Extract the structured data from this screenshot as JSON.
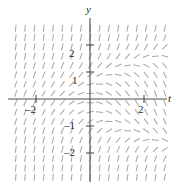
{
  "figure": {
    "width": 179,
    "height": 186,
    "background_color": "#ffffff",
    "mark_color": "#a9a9ac",
    "axis_color": "#4d4d4f",
    "text_color": "#231f20"
  },
  "axes": {
    "x_axis_label": "t",
    "y_axis_label": "y",
    "origin_px": {
      "x": 90,
      "y": 99
    },
    "unit_px": {
      "x": 27,
      "y": 27
    },
    "xlim": [
      -2.9,
      2.8
    ],
    "ylim": [
      -3.0,
      2.9
    ],
    "grid": false,
    "x_ticks": [
      {
        "value": -2,
        "label": "–2"
      },
      {
        "value": 2,
        "label": "2"
      }
    ],
    "y_ticks": [
      {
        "value": 2,
        "label": "2"
      },
      {
        "value": 1,
        "label": "1"
      },
      {
        "value": -1,
        "label": "–1"
      },
      {
        "value": -2,
        "label": "–2"
      }
    ]
  },
  "chart_data": {
    "type": "scatter",
    "xlabel": "t",
    "ylabel": "y",
    "xlim": [
      -2.9,
      2.8
    ],
    "ylim": [
      -3.0,
      2.9
    ],
    "grid": false,
    "plot_rect_px": {
      "left": 13,
      "top": 20,
      "right": 165,
      "bottom": 180
    },
    "mark_length_px": 7,
    "mark_color": "#a9a9ac",
    "mark_grid": {
      "x_start": -2.75,
      "x_step": 0.345,
      "x_count": 17,
      "y_start": -2.9,
      "y_step": 0.345,
      "y_count": 18
    },
    "slope_rule": "dy/dt = y*y - t",
    "slope_description": "Slope at each lattice point equals y squared minus t; marks are steep (near vertical) for |y| large and tilt toward the horizontal near the t-axis, leaning forward-slash on the left of the y-axis and back-slash on the lower right.",
    "notes": [
      "Tick marks on t-axis at -2 and 2 only",
      "Tick marks on y-axis at -2, -1, 1, 2",
      "Short line segments of uniform length drawn on a regular lattice"
    ]
  },
  "labels": {
    "y": "y",
    "t": "t",
    "y2": "2",
    "y1": "1",
    "ym1": "–1",
    "ym2": "–2",
    "tm2": "–2",
    "t2": "2"
  }
}
